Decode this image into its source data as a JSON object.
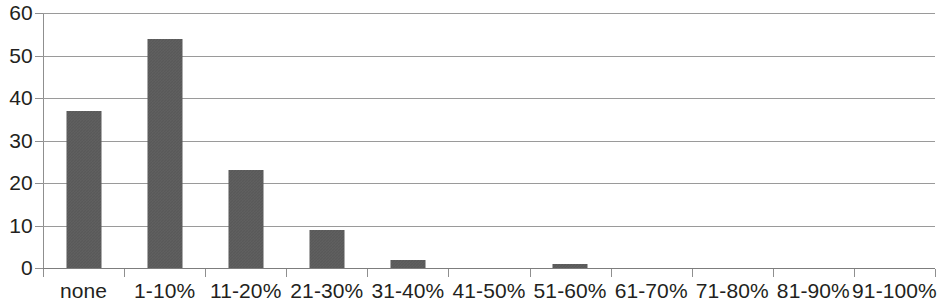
{
  "chart_data": {
    "type": "bar",
    "title": "",
    "subtitle": "",
    "xlabel": "",
    "ylabel": "",
    "categories": [
      "none",
      "1-10%",
      "11-20%",
      "21-30%",
      "31-40%",
      "41-50%",
      "51-60%",
      "61-70%",
      "71-80%",
      "81-90%",
      "91-100%"
    ],
    "values": [
      37,
      54,
      23,
      9,
      2,
      0,
      1,
      0,
      0,
      0,
      0
    ],
    "series": [
      {
        "name": "",
        "values": [
          37,
          54,
          23,
          9,
          2,
          0,
          1,
          0,
          0,
          0,
          0
        ]
      }
    ],
    "ylim": [
      0,
      60
    ],
    "yticks": [
      0,
      10,
      20,
      30,
      40,
      50,
      60
    ],
    "ytick_labels": [
      "0",
      "10",
      "20",
      "30",
      "40",
      "50",
      "60"
    ],
    "grid": true,
    "grid_axis": "y",
    "legend": false,
    "legend_position": "none",
    "bar_color": "#595959",
    "gridline_color": "#9a9a9a",
    "axis_color": "#8f8f8f",
    "text_color": "#231f20",
    "background_color": "#ffffff",
    "annotations": []
  }
}
